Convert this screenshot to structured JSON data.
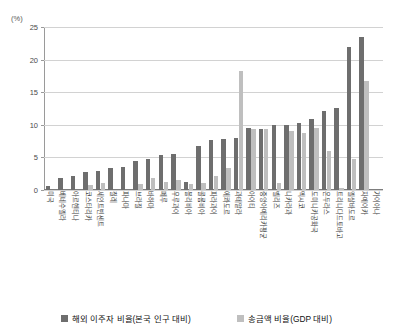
{
  "chart_data": {
    "type": "bar",
    "title": "",
    "xlabel": "",
    "ylabel": "(%)",
    "ylim": [
      0,
      25
    ],
    "yticks": [
      0,
      5,
      10,
      15,
      20,
      25
    ],
    "grid": true,
    "legend_position": "bottom",
    "categories": [
      "미국",
      "베네수엘라",
      "아르헨티나",
      "코스타리카",
      "세인트빈센트",
      "칠레",
      "파나마",
      "브라질",
      "바하마",
      "페루",
      "우루과이",
      "볼리비아",
      "콜롬비아",
      "파라과이",
      "에콰도르",
      "과테말라",
      "아이티",
      "중앙아메리카평균",
      "벨리즈",
      "니카라과",
      "멕시코",
      "도미니카공화국",
      "온두라스",
      "트리니다드토바고",
      "엘살바도르",
      "자메이카",
      "가이아나"
    ],
    "series": [
      {
        "name": "해외 이주자 비율(본국 인구 대비)",
        "color": "#6e6e6e",
        "values": [
          0.6,
          1.9,
          2.1,
          2.7,
          2.9,
          3.3,
          3.6,
          4.5,
          4.8,
          5.4,
          5.6,
          1.2,
          6.8,
          7.7,
          7.8,
          8.0,
          9.5,
          9.4,
          9.9,
          10.0,
          10.3,
          10.9,
          12.1,
          12.6,
          21.9,
          23.5,
          0.0
        ]
      },
      {
        "name": "송금액 비율(GDP 대비)",
        "color": "#bfbfbf",
        "values": [
          0.0,
          0.0,
          0.0,
          0.8,
          1.0,
          0.0,
          0.0,
          0.9,
          1.8,
          1.2,
          1.5,
          0.9,
          1.1,
          2.1,
          3.3,
          18.3,
          9.4,
          9.3,
          1.0,
          9.0,
          8.8,
          9.5,
          6.0,
          0.3,
          4.7,
          16.7,
          0.0
        ]
      }
    ]
  },
  "legend": {
    "items": [
      {
        "label": "해외 이주자 비율(본국 인구 대비)",
        "swatch": "dark"
      },
      {
        "label": "송금액 비율(GDP 대비)",
        "swatch": "light"
      }
    ]
  },
  "axis": {
    "unit_label": "(%)",
    "tick_labels": [
      "25",
      "20",
      "15",
      "10",
      "5",
      "0"
    ]
  }
}
